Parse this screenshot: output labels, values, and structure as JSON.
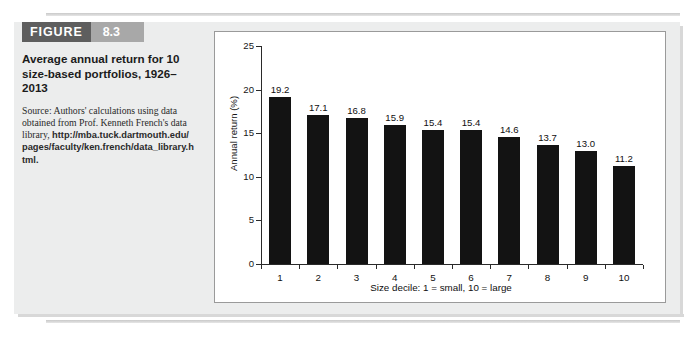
{
  "figure": {
    "tag_word": "FIGURE",
    "tag_number": "8.3",
    "title": "Average annual return for 10 size-based portfolios, 1926–2013",
    "source_intro": "Source: Authors' calculations using data obtained from Prof. Kenneth French's data library,",
    "source_url": "http://mba.tuck.dartmouth.edu/pages/faculty/ken.french/data_library.html.",
    "tag_word_color": "#5e5e5e",
    "tag_number_color": "#a8a8a8"
  },
  "chart_data": {
    "type": "bar",
    "title": "",
    "categories": [
      "1",
      "2",
      "3",
      "4",
      "5",
      "6",
      "7",
      "8",
      "9",
      "10"
    ],
    "values": [
      19.2,
      17.1,
      16.8,
      15.9,
      15.4,
      15.4,
      14.6,
      13.7,
      13.0,
      11.2
    ],
    "data_labels": [
      "19.2",
      "17.1",
      "16.8",
      "15.9",
      "15.4",
      "15.4",
      "14.6",
      "13.7",
      "13.0",
      "11.2"
    ],
    "xlabel": "Size decile: 1 = small, 10 = large",
    "ylabel": "Annual return (%)",
    "ylim": [
      0,
      25
    ],
    "yticks": [
      0,
      5,
      10,
      15,
      20,
      25
    ],
    "ytick_labels": [
      "0",
      "5",
      "10",
      "15",
      "20",
      "25"
    ],
    "grid": false,
    "legend": false,
    "bar_color": "#131313"
  }
}
